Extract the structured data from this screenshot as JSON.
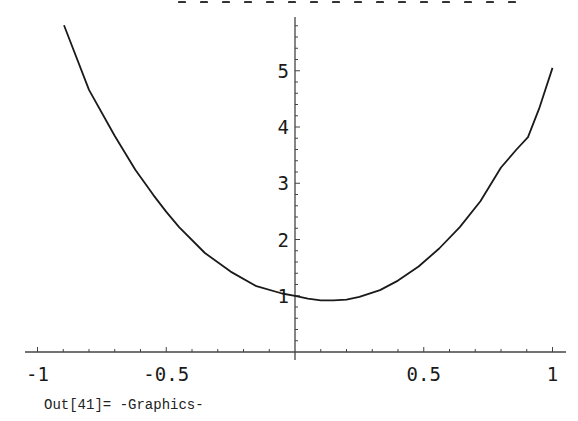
{
  "chart_data": {
    "type": "line",
    "title": "",
    "xlabel": "",
    "ylabel": "",
    "xlim": [
      -1.05,
      1.05
    ],
    "ylim": [
      0,
      5.9
    ],
    "grid": false,
    "legend": null,
    "x_ticks": [
      -1,
      -0.5,
      0.5,
      1
    ],
    "x_tick_labels": [
      "-1",
      "-0.5",
      "0.5",
      "1"
    ],
    "y_ticks": [
      1,
      2,
      3,
      4,
      5
    ],
    "y_tick_labels": [
      "1",
      "2",
      "3",
      "4",
      "5"
    ],
    "series": [
      {
        "name": "curve",
        "color": "#1a1a1a",
        "x": [
          -0.897,
          -0.8,
          -0.7,
          -0.62,
          -0.55,
          -0.5,
          -0.45,
          -0.35,
          -0.25,
          -0.15,
          -0.05,
          0.0,
          0.05,
          0.1,
          0.15,
          0.2,
          0.25,
          0.33,
          0.4,
          0.48,
          0.56,
          0.64,
          0.72,
          0.8,
          0.86,
          0.905,
          0.95,
          1.0
        ],
        "values": [
          5.81,
          4.66,
          3.84,
          3.24,
          2.79,
          2.49,
          2.22,
          1.76,
          1.43,
          1.17,
          1.04,
          1.0,
          0.95,
          0.92,
          0.92,
          0.93,
          0.98,
          1.1,
          1.27,
          1.52,
          1.84,
          2.22,
          2.68,
          3.28,
          3.6,
          3.82,
          4.35,
          5.05
        ]
      }
    ]
  },
  "output": {
    "label": "Out[41]=",
    "value": "-Graphics-"
  }
}
